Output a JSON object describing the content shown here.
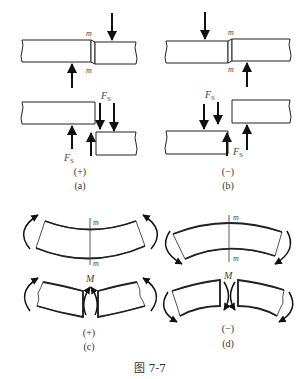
{
  "figure": {
    "caption": "图 7-7",
    "colors": {
      "line": "#222222",
      "label": "#444444",
      "background": "#ffffff"
    }
  },
  "panels": {
    "a": {
      "sign": "(+)",
      "label": "(a)",
      "section_top": "m",
      "section_bottom": "m",
      "force_label_top": "F",
      "force_label_top_sub": "S",
      "force_label_bottom": "F",
      "force_label_bottom_sub": "S"
    },
    "b": {
      "sign": "(−)",
      "label": "(b)",
      "section_top": "m",
      "section_bottom": "m",
      "force_label_top": "F",
      "force_label_top_sub": "S",
      "force_label_bottom": "F",
      "force_label_bottom_sub": "S"
    },
    "c": {
      "sign": "(+)",
      "label": "(c)",
      "section_top": "m",
      "section_bottom": "m",
      "moment_label": "M"
    },
    "d": {
      "sign": "(−)",
      "label": "(d)",
      "section_top": "m",
      "section_bottom": "m",
      "moment_label": "M"
    }
  },
  "icons": {
    "arrow": "force-arrow",
    "curved_arrow": "moment-arrow"
  }
}
